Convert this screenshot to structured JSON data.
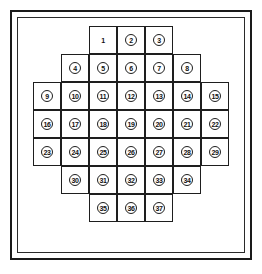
{
  "figure": {
    "background_color": "#ffffff",
    "line_color": "#1e1e1e",
    "border_color": "#1a1a1a"
  },
  "grid": {
    "columns": 7,
    "rows": 7,
    "cell_width": 28,
    "cell_height": 28,
    "origin_x": 33,
    "origin_y": 26,
    "total_cells": 37,
    "rows_data": [
      {
        "row": 1,
        "start_column": 3,
        "count": 3,
        "cells": [
          {
            "number": "1",
            "circled": false
          },
          {
            "number": "2",
            "circled": true
          },
          {
            "number": "3",
            "circled": true
          }
        ]
      },
      {
        "row": 2,
        "start_column": 2,
        "count": 5,
        "cells": [
          {
            "number": "4",
            "circled": true
          },
          {
            "number": "5",
            "circled": true
          },
          {
            "number": "6",
            "circled": true
          },
          {
            "number": "7",
            "circled": true
          },
          {
            "number": "8",
            "circled": true
          }
        ]
      },
      {
        "row": 3,
        "start_column": 1,
        "count": 7,
        "cells": [
          {
            "number": "9",
            "circled": true
          },
          {
            "number": "10",
            "circled": true
          },
          {
            "number": "11",
            "circled": true
          },
          {
            "number": "12",
            "circled": true
          },
          {
            "number": "13",
            "circled": true
          },
          {
            "number": "14",
            "circled": true
          },
          {
            "number": "15",
            "circled": true
          }
        ]
      },
      {
        "row": 4,
        "start_column": 1,
        "count": 7,
        "cells": [
          {
            "number": "16",
            "circled": true
          },
          {
            "number": "17",
            "circled": true
          },
          {
            "number": "18",
            "circled": true
          },
          {
            "number": "19",
            "circled": true
          },
          {
            "number": "20",
            "circled": true
          },
          {
            "number": "21",
            "circled": true
          },
          {
            "number": "22",
            "circled": true
          }
        ]
      },
      {
        "row": 5,
        "start_column": 1,
        "count": 7,
        "cells": [
          {
            "number": "23",
            "circled": true
          },
          {
            "number": "24",
            "circled": true
          },
          {
            "number": "25",
            "circled": true
          },
          {
            "number": "26",
            "circled": true
          },
          {
            "number": "27",
            "circled": true
          },
          {
            "number": "28",
            "circled": true
          },
          {
            "number": "29",
            "circled": true
          }
        ]
      },
      {
        "row": 6,
        "start_column": 2,
        "count": 5,
        "cells": [
          {
            "number": "30",
            "circled": true
          },
          {
            "number": "31",
            "circled": true
          },
          {
            "number": "32",
            "circled": true
          },
          {
            "number": "33",
            "circled": true
          },
          {
            "number": "34",
            "circled": true
          }
        ]
      },
      {
        "row": 7,
        "start_column": 3,
        "count": 3,
        "cells": [
          {
            "number": "35",
            "circled": true
          },
          {
            "number": "36",
            "circled": true
          },
          {
            "number": "37",
            "circled": true
          }
        ]
      }
    ]
  }
}
